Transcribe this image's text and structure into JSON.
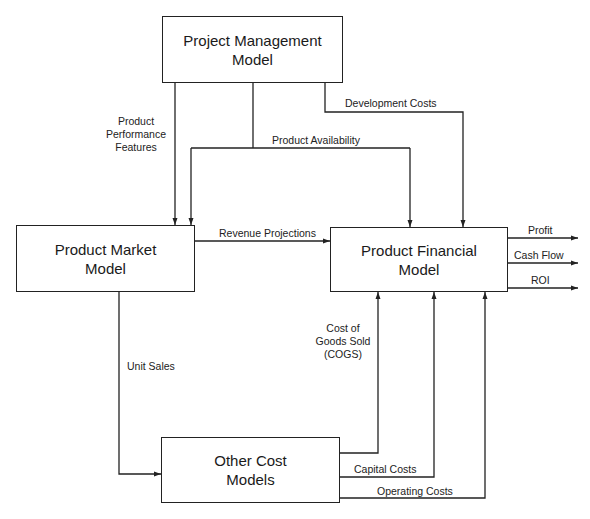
{
  "diagram": {
    "nodes": {
      "project_management": {
        "line1": "Project Management",
        "line2": "Model"
      },
      "product_market": {
        "line1": "Product Market",
        "line2": "Model"
      },
      "product_financial": {
        "line1": "Product Financial",
        "line2": "Model"
      },
      "other_cost": {
        "line1": "Other Cost",
        "line2": "Models"
      }
    },
    "edges": {
      "product_performance": {
        "line1": "Product",
        "line2": "Performance",
        "line3": "Features"
      },
      "product_availability": "Product Availability",
      "development_costs": "Development Costs",
      "revenue_projections": "Revenue Projections",
      "unit_sales": "Unit Sales",
      "cogs": {
        "line1": "Cost of",
        "line2": "Goods Sold",
        "line3": "(COGS)"
      },
      "capital_costs": "Capital Costs",
      "operating_costs": "Operating Costs"
    },
    "outputs": {
      "profit": "Profit",
      "cash_flow": "Cash Flow",
      "roi": "ROI"
    }
  }
}
